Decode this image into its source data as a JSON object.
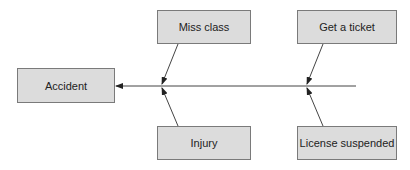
{
  "diagram": {
    "type": "cause-effect",
    "effect": {
      "label": "Accident"
    },
    "causes": [
      {
        "id": "miss",
        "label": "Miss class",
        "position": "top"
      },
      {
        "id": "ticket",
        "label": "Get a ticket",
        "position": "top"
      },
      {
        "id": "injury",
        "label": "Injury",
        "position": "bottom"
      },
      {
        "id": "license",
        "label": "License suspended",
        "position": "bottom"
      }
    ],
    "edges": [
      {
        "from": "spine",
        "to": "Accident"
      },
      {
        "from": "Miss class",
        "to": "spine"
      },
      {
        "from": "Injury",
        "to": "spine"
      },
      {
        "from": "Get a ticket",
        "to": "spine"
      },
      {
        "from": "License suspended",
        "to": "spine"
      }
    ],
    "colors": {
      "box_fill": "#dcdcdc",
      "box_border": "#7a7a7a",
      "line": "#333333",
      "text": "#222222"
    }
  }
}
